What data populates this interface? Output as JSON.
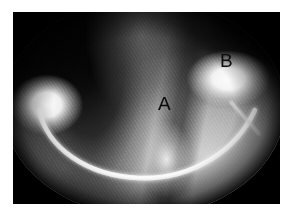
{
  "figure": {
    "kind": "grayscale-radiographic-image",
    "caption": "",
    "frame": {
      "page_background_color": "#ffffff",
      "image_background_color": "#000000",
      "margin_px": 13
    },
    "field_of_view": {
      "shape": "oval",
      "label": "oval field of view"
    },
    "annotations": [
      {
        "id": "annot-a",
        "label": "A",
        "x": 145,
        "y": 83,
        "color": "#0b0b0b",
        "description": "label on central tooth structure"
      },
      {
        "id": "annot-b",
        "label": "B",
        "x": 207,
        "y": 40,
        "color": "#0b0b0b",
        "description": "label on right-side structure"
      }
    ],
    "structures": [
      {
        "name": "bright-left-blob",
        "description": "bright rounded radiopaque mass, left side"
      },
      {
        "name": "bright-right-blob",
        "description": "bright rounded radiopaque mass, upper right"
      },
      {
        "name": "archwire",
        "description": "bright curved wire arcing across the lower field"
      },
      {
        "name": "dark-wedge-left",
        "description": "dark interdental shadow left of centre"
      },
      {
        "name": "dark-separation",
        "description": "dark vertical separation right of centre"
      },
      {
        "name": "bright-cusp",
        "description": "bright cusp tip below label A"
      }
    ],
    "palette": {
      "white": "#ffffff",
      "black": "#000000",
      "highlight": "#fafafa",
      "midtone": "#9a9a9a",
      "shadow": "#1a1a1a",
      "annotation_text": "#0b0b0b"
    }
  }
}
